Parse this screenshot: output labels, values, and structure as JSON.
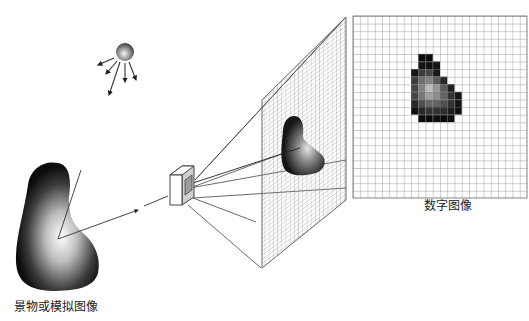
{
  "diagram": {
    "labels": {
      "scene": "景物或模拟图像",
      "digital_image": "数字图像"
    },
    "components": [
      {
        "id": "light-source",
        "description": "Spherical light source emitting rays"
      },
      {
        "id": "scene-object",
        "description": "Shaded 3D object (scene / analog image)"
      },
      {
        "id": "camera",
        "description": "Imaging device / lens box"
      },
      {
        "id": "sampling-grid",
        "description": "Perspective image plane with sampling grid and projected object"
      },
      {
        "id": "digital-grid",
        "description": "Digital image pixel grid with quantized blob"
      }
    ],
    "digital_grid": {
      "cols": 24,
      "rows": 24,
      "pixels": [
        {
          "r": 5,
          "c": 9,
          "v": 10
        },
        {
          "r": 5,
          "c": 10,
          "v": 10
        },
        {
          "r": 6,
          "c": 9,
          "v": 20
        },
        {
          "r": 6,
          "c": 10,
          "v": 15
        },
        {
          "r": 6,
          "c": 11,
          "v": 20
        },
        {
          "r": 7,
          "c": 8,
          "v": 20
        },
        {
          "r": 7,
          "c": 9,
          "v": 60
        },
        {
          "r": 7,
          "c": 10,
          "v": 70
        },
        {
          "r": 7,
          "c": 11,
          "v": 25
        },
        {
          "r": 8,
          "c": 8,
          "v": 60
        },
        {
          "r": 8,
          "c": 9,
          "v": 110
        },
        {
          "r": 8,
          "c": 10,
          "v": 130
        },
        {
          "r": 8,
          "c": 11,
          "v": 90
        },
        {
          "r": 8,
          "c": 12,
          "v": 40
        },
        {
          "r": 9,
          "c": 8,
          "v": 70
        },
        {
          "r": 9,
          "c": 9,
          "v": 130
        },
        {
          "r": 9,
          "c": 10,
          "v": 190
        },
        {
          "r": 9,
          "c": 11,
          "v": 150
        },
        {
          "r": 9,
          "c": 12,
          "v": 90
        },
        {
          "r": 9,
          "c": 13,
          "v": 30
        },
        {
          "r": 10,
          "c": 8,
          "v": 70
        },
        {
          "r": 10,
          "c": 9,
          "v": 120
        },
        {
          "r": 10,
          "c": 10,
          "v": 160
        },
        {
          "r": 10,
          "c": 11,
          "v": 140
        },
        {
          "r": 10,
          "c": 12,
          "v": 100
        },
        {
          "r": 10,
          "c": 13,
          "v": 50
        },
        {
          "r": 10,
          "c": 14,
          "v": 20
        },
        {
          "r": 11,
          "c": 8,
          "v": 40
        },
        {
          "r": 11,
          "c": 9,
          "v": 80
        },
        {
          "r": 11,
          "c": 10,
          "v": 100
        },
        {
          "r": 11,
          "c": 11,
          "v": 100
        },
        {
          "r": 11,
          "c": 12,
          "v": 80
        },
        {
          "r": 11,
          "c": 13,
          "v": 50
        },
        {
          "r": 11,
          "c": 14,
          "v": 20
        },
        {
          "r": 12,
          "c": 8,
          "v": 15
        },
        {
          "r": 12,
          "c": 9,
          "v": 40
        },
        {
          "r": 12,
          "c": 10,
          "v": 50
        },
        {
          "r": 12,
          "c": 11,
          "v": 50
        },
        {
          "r": 12,
          "c": 12,
          "v": 45
        },
        {
          "r": 12,
          "c": 13,
          "v": 30
        },
        {
          "r": 12,
          "c": 14,
          "v": 15
        },
        {
          "r": 13,
          "c": 9,
          "v": 10
        },
        {
          "r": 13,
          "c": 10,
          "v": 10
        },
        {
          "r": 13,
          "c": 11,
          "v": 15
        },
        {
          "r": 13,
          "c": 12,
          "v": 10
        },
        {
          "r": 13,
          "c": 13,
          "v": 15
        }
      ]
    }
  }
}
